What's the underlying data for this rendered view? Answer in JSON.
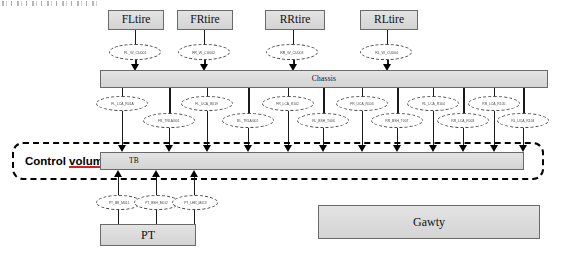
{
  "diagram": {
    "tires": [
      {
        "label": "FLtire",
        "x": 108,
        "y": 10,
        "w": 56,
        "h": 20
      },
      {
        "label": "FRtire",
        "x": 177,
        "y": 10,
        "w": 56,
        "h": 20
      },
      {
        "label": "RRtire",
        "x": 265,
        "y": 10,
        "w": 60,
        "h": 20
      },
      {
        "label": "RLtire",
        "x": 360,
        "y": 10,
        "w": 58,
        "h": 20
      }
    ],
    "chassis_bar": {
      "label": "Chassis",
      "x": 100,
      "y": 70,
      "w": 448,
      "h": 18
    },
    "tb_bar": {
      "label": "TB",
      "x": 100,
      "y": 152,
      "w": 424,
      "h": 18
    },
    "pt_box": {
      "label": "PT",
      "x": 100,
      "y": 224,
      "w": 96,
      "h": 22
    },
    "gawty_box": {
      "label": "Gawty",
      "x": 318,
      "y": 205,
      "w": 222,
      "h": 34
    },
    "control_volume": {
      "label_prefix": "Control ",
      "label_underlined": "volumn"
    },
    "tire_nodes": [
      {
        "label": "FL_W_CU001",
        "x": 109,
        "y": 44
      },
      {
        "label": "FR_W_CU002",
        "x": 178,
        "y": 44
      },
      {
        "label": "RR_W_CU003",
        "x": 266,
        "y": 44
      },
      {
        "label": "RL_W_CU004",
        "x": 360,
        "y": 44
      }
    ],
    "upper_nodes": [
      {
        "label": "FL_LCA_R01A",
        "x": 96,
        "y": 96
      },
      {
        "label": "FL_UCA_R019",
        "x": 181,
        "y": 96
      },
      {
        "label": "FR_LCA_R102",
        "x": 262,
        "y": 96
      },
      {
        "label": "FR_UCA_R103",
        "x": 336,
        "y": 96
      },
      {
        "label": "RL_LCA_R104",
        "x": 407,
        "y": 96
      },
      {
        "label": "RR_LCA_R105",
        "x": 468,
        "y": 96
      }
    ],
    "lower_nodes": [
      {
        "label": "FR_TRLA/001",
        "x": 143,
        "y": 113
      },
      {
        "label": "RL_TRLA/002",
        "x": 222,
        "y": 113
      },
      {
        "label": "RL_BSH_T006",
        "x": 297,
        "y": 113
      },
      {
        "label": "RR_BSH_T007",
        "x": 371,
        "y": 113
      },
      {
        "label": "RR_LCA_R003",
        "x": 437,
        "y": 113
      },
      {
        "label": "RL_UCA_R104",
        "x": 497,
        "y": 113
      }
    ],
    "pt_nodes": [
      {
        "label": "PT_BR_M011",
        "x": 100,
        "y": 195
      },
      {
        "label": "PT_BSH_M012",
        "x": 134,
        "y": 195
      },
      {
        "label": "PT_LHR_M013",
        "x": 168,
        "y": 195
      }
    ],
    "colors": {
      "block_fill": "#dcdcdc",
      "block_border": "#6a6a6a",
      "line": "#1a1a1a",
      "underline_red": "#d02020",
      "background": "#ffffff"
    }
  }
}
